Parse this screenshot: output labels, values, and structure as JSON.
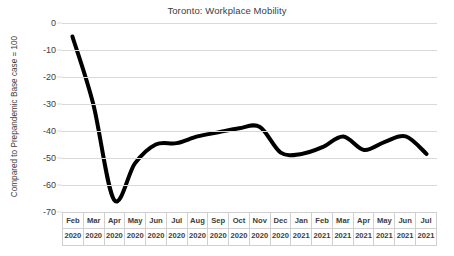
{
  "chart_data": {
    "type": "line",
    "title": "Toronto: Workplace Mobility",
    "xlabel": "",
    "ylabel": "Compared to Prepandemic Base case = 100",
    "ylim": [
      -70,
      0
    ],
    "ytick_step": 10,
    "grid": true,
    "legend": "none",
    "line_color": "#000000",
    "line_width": 4,
    "gridline_color": "#d9d9d9",
    "categories": [
      "Feb 2020",
      "Mar 2020",
      "Apr 2020",
      "May 2020",
      "Jun 2020",
      "Jul 2020",
      "Aug 2020",
      "Sep 2020",
      "Oct 2020",
      "Nov 2020",
      "Dec 2020",
      "Jan 2021",
      "Feb 2021",
      "Mar 2021",
      "Apr 2021",
      "May 2021",
      "Jun 2021",
      "Jul 2021"
    ],
    "x_months": [
      "Feb",
      "Mar",
      "Apr",
      "May",
      "Jun",
      "Jul",
      "Aug",
      "Sep",
      "Oct",
      "Nov",
      "Dec",
      "Jan",
      "Feb",
      "Mar",
      "Apr",
      "May",
      "Jun",
      "Jul"
    ],
    "x_years": [
      "2020",
      "2020",
      "2020",
      "2020",
      "2020",
      "2020",
      "2020",
      "2020",
      "2020",
      "2020",
      "2020",
      "2021",
      "2021",
      "2021",
      "2021",
      "2021",
      "2021",
      "2021"
    ],
    "ytick_labels": [
      "0",
      "-10",
      "-20",
      "-30",
      "-40",
      "-50",
      "-60",
      "-70"
    ],
    "ytick_values": [
      0,
      -10,
      -20,
      -30,
      -40,
      -50,
      -60,
      -70
    ],
    "values": [
      -5,
      -30,
      -65.5,
      -52,
      -45,
      -44.5,
      -42,
      -40.5,
      -39,
      -38.5,
      -48,
      -48.5,
      -46,
      -42,
      -47,
      -44,
      -42,
      -48.5
    ],
    "series": [
      {
        "name": "Workplace Mobility",
        "values": [
          -5,
          -30,
          -65.5,
          -52,
          -45,
          -44.5,
          -42,
          -40.5,
          -39,
          -38.5,
          -48,
          -48.5,
          -46,
          -42,
          -47,
          -44,
          -42,
          -48.5
        ]
      }
    ]
  }
}
